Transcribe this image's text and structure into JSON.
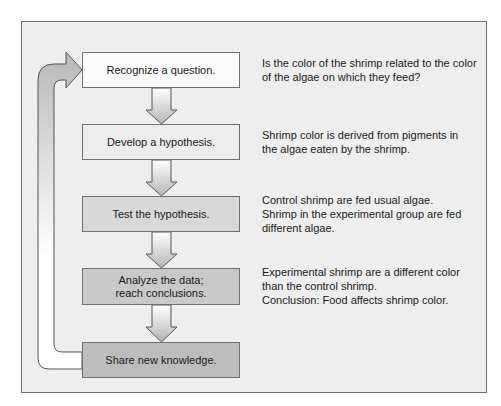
{
  "diagram": {
    "title": "",
    "type": "scientific-method-flowchart",
    "colors": {
      "frame_background": "#eeeeee",
      "frame_border": "#6e6e6e",
      "box_border": "#707070",
      "arrow_light": "#ffffff",
      "arrow_dark": "#b8b8b8"
    },
    "steps": [
      {
        "label": "Recognize a question.",
        "fill": "#fbfbfb",
        "description": "Is the color of the shrimp related to the color\nof the algae on which they feed?"
      },
      {
        "label": "Develop a hypothesis.",
        "fill": "#ececec",
        "description": "Shrimp color is derived from pigments in\nthe algae eaten by the shrimp."
      },
      {
        "label": "Test the hypothesis.",
        "fill": "#d8d8d8",
        "description": "Control shrimp are fed usual algae.\nShrimp in the experimental group are fed\ndifferent algae."
      },
      {
        "label": "Analyze the data;\nreach conclusions.",
        "fill": "#c9c9c9",
        "description": "Experimental shrimp are a different color\nthan the control shrimp.\nConclusion: Food affects shrimp color."
      },
      {
        "label": "Share new knowledge.",
        "fill": "#bdbdbd",
        "description": ""
      }
    ],
    "connectors": [
      {
        "from": 0,
        "to": 1,
        "type": "down-arrow"
      },
      {
        "from": 1,
        "to": 2,
        "type": "down-arrow"
      },
      {
        "from": 2,
        "to": 3,
        "type": "down-arrow"
      },
      {
        "from": 3,
        "to": 4,
        "type": "down-arrow"
      },
      {
        "from": 4,
        "to": 0,
        "type": "loop-back-arrow"
      }
    ]
  }
}
